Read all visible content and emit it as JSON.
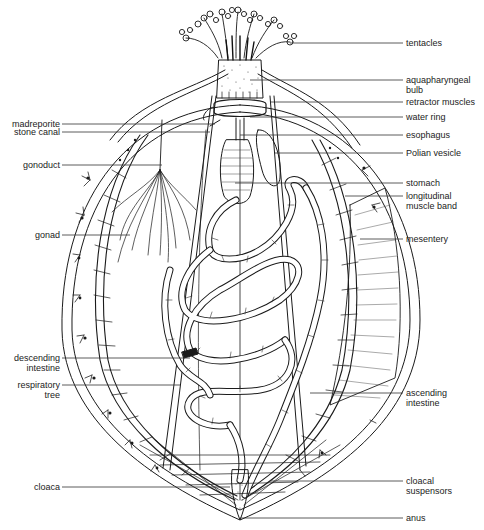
{
  "diagram": {
    "colors": {
      "ink": "#1a1a1a",
      "line": "#333333",
      "background": "#ffffff",
      "stipple": "#555555"
    },
    "labels_right": [
      {
        "id": "tentacles",
        "text": "tentacles",
        "line2": "",
        "y": 43,
        "x_from": 290
      },
      {
        "id": "aquapharyngeal-bulb",
        "text": "aquapharyngeal",
        "line2": "bulb",
        "y": 80,
        "x_from": 250
      },
      {
        "id": "retractor-muscles",
        "text": "retractor muscles",
        "line2": "",
        "y": 102,
        "x_from": 270
      },
      {
        "id": "water-ring",
        "text": "water ring",
        "line2": "",
        "y": 117,
        "x_from": 250
      },
      {
        "id": "esophagus",
        "text": "esophagus",
        "line2": "",
        "y": 135,
        "x_from": 240
      },
      {
        "id": "polian-vesicle",
        "text": "Polian vesicle",
        "line2": "",
        "y": 153,
        "x_from": 275
      },
      {
        "id": "stomach",
        "text": "stomach",
        "line2": "",
        "y": 183,
        "x_from": 235
      },
      {
        "id": "longitudinal-muscle-band",
        "text": "longitudinal",
        "line2": "muscle band",
        "y": 196,
        "x_from": 345
      },
      {
        "id": "mesentery",
        "text": "mesentery",
        "line2": "",
        "y": 239,
        "x_from": 360
      },
      {
        "id": "ascending-intestine",
        "text": "ascending",
        "line2": "intestine",
        "y": 393,
        "x_from": 310
      },
      {
        "id": "cloacal-suspensors",
        "text": "cloacal",
        "line2": "suspensors",
        "y": 481,
        "x_from": 270
      },
      {
        "id": "anus",
        "text": "anus",
        "line2": "",
        "y": 518,
        "x_from": 240
      }
    ],
    "labels_left": [
      {
        "id": "madreporite",
        "text": "madreporite",
        "line2": "",
        "y": 124,
        "x_to": 215
      },
      {
        "id": "stone-canal",
        "text": "stone canal",
        "line2": "",
        "y": 132,
        "x_to": 210
      },
      {
        "id": "gonoduct",
        "text": "gonoduct",
        "line2": "",
        "y": 165,
        "x_to": 162
      },
      {
        "id": "gonad",
        "text": "gonad",
        "line2": "",
        "y": 235,
        "x_to": 130
      },
      {
        "id": "descending-intestine",
        "text": "descending",
        "line2": "intestine",
        "y": 358,
        "x_to": 190
      },
      {
        "id": "respiratory-tree",
        "text": "respiratory",
        "line2": "tree",
        "y": 385,
        "x_to": 180
      },
      {
        "id": "cloaca",
        "text": "cloaca",
        "line2": "",
        "y": 487,
        "x_to": 230
      }
    ]
  }
}
